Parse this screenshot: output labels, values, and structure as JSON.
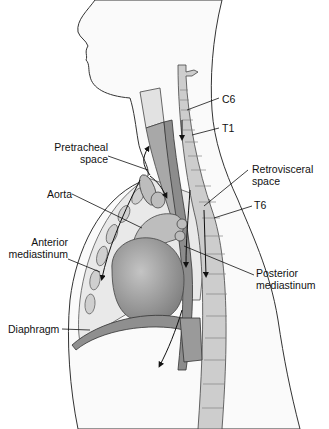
{
  "figure": {
    "labels": {
      "c6": "C6",
      "t1": "T1",
      "pretracheal_1": "Pretracheal",
      "pretracheal_2": "space",
      "retrovisceral_1": "Retrovisceral",
      "retrovisceral_2": "space",
      "t6": "T6",
      "aorta": "Aorta",
      "anterior_1": "Anterior",
      "anterior_2": "mediastinum",
      "posterior_1": "Posterior",
      "posterior_2": "mediastinum",
      "diaphragm": "Diaphragm"
    },
    "colors": {
      "outline": "#333333",
      "tissue": "#e6e6e6",
      "organ": "#9a9a9a",
      "spine": "#c8c8c8",
      "label": "#111111"
    }
  }
}
